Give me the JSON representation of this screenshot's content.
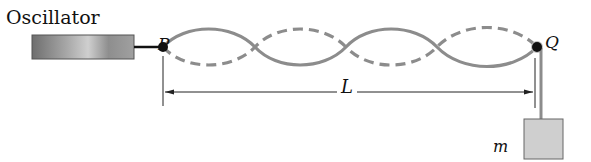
{
  "diagram": {
    "labels": {
      "oscillator": "Oscillator",
      "point_p": "P",
      "point_q": "Q",
      "length": "L",
      "mass": "m"
    },
    "wave": {
      "loops": 4,
      "solid_curve": "string at one extreme",
      "dashed_curve": "string at opposite extreme"
    },
    "colors": {
      "string": "#8c8c8c",
      "oscillator_fill": "#8a8a8a",
      "mass_fill": "#cfcfcf",
      "ink": "#111111"
    }
  }
}
